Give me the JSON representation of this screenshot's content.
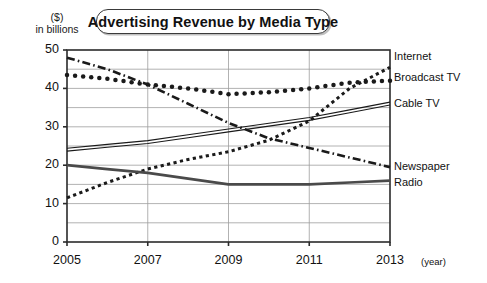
{
  "title": "Advertising Revenue by Media Type",
  "axis_caption": {
    "line1": "($)",
    "line2": "in billions"
  },
  "x_unit_label": "(year)",
  "y_ticks": [
    "0",
    "10",
    "20",
    "30",
    "40",
    "50"
  ],
  "x_ticks": [
    "2005",
    "2007",
    "2009",
    "2011",
    "2013"
  ],
  "series_labels": {
    "internet": "Internet",
    "broadcast_tv": "Broadcast TV",
    "cable_tv": "Cable TV",
    "newspaper": "Newspaper",
    "radio": "Radio"
  },
  "colors": {
    "ink": "#1a1a1a",
    "grid": "#9a9a9a",
    "axis": "#2b2b2b",
    "background": "#ffffff"
  },
  "chart_data": {
    "type": "line",
    "title": "Advertising Revenue by Media Type",
    "xlabel": "(year)",
    "ylabel": "($) in billions",
    "xlim": [
      2005,
      2013
    ],
    "ylim": [
      0,
      50
    ],
    "ytick_step": 10,
    "gridline_step": 5,
    "grid": true,
    "legend_position": "right-inline-labels",
    "x": [
      2005,
      2006,
      2007,
      2008,
      2009,
      2010,
      2011,
      2012,
      2013
    ],
    "series": [
      {
        "name": "Internet",
        "style": "fine-dotted",
        "values": [
          11.5,
          15.5,
          19.0,
          21.5,
          23.5,
          26.5,
          31.5,
          40.0,
          45.5
        ]
      },
      {
        "name": "Broadcast TV",
        "style": "round-dotted",
        "values": [
          43.5,
          42.5,
          41.0,
          40.0,
          38.5,
          39.0,
          40.0,
          41.5,
          42.0
        ]
      },
      {
        "name": "Cable TV",
        "style": "double-solid-thin",
        "values": [
          24.0,
          25.0,
          26.0,
          27.5,
          29.0,
          30.5,
          32.0,
          34.0,
          36.0
        ]
      },
      {
        "name": "Newspaper",
        "style": "dash-dot",
        "values": [
          48.0,
          45.0,
          41.0,
          36.0,
          31.0,
          27.0,
          24.5,
          22.0,
          19.5
        ]
      },
      {
        "name": "Radio",
        "style": "thick-solid",
        "values": [
          20.0,
          19.0,
          18.0,
          16.5,
          15.0,
          15.0,
          15.0,
          15.5,
          16.0
        ]
      }
    ]
  }
}
